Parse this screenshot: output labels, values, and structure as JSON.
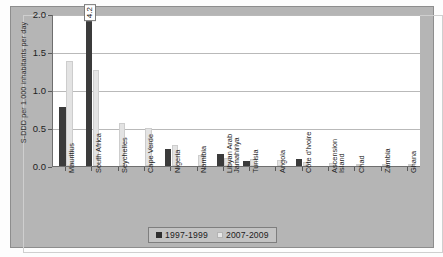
{
  "chart_data": {
    "type": "bar",
    "title": "",
    "xlabel": "",
    "ylabel": "S-DDD per 1.000 inhabitants per day",
    "ylim": [
      0,
      2.0
    ],
    "yticks": [
      "0.0",
      "0.5",
      "1.0",
      "1.5",
      "2.0"
    ],
    "grid": true,
    "legend_position": "bottom",
    "categories": [
      "Mauritius",
      "South Africa",
      "Seychelles",
      "Cape Verde",
      "Nigeria",
      "Namibia",
      "Libyan Arab Jamahiriya",
      "Tunisia",
      "Angola",
      "Côte d'Ivoire",
      "Ascension Island",
      "Chad",
      "Zambia",
      "Ghana"
    ],
    "series": [
      {
        "name": "1997-1999",
        "color": "#3b3b3b",
        "values": [
          0.78,
          4.2,
          0.0,
          0.0,
          0.22,
          0.0,
          0.16,
          0.07,
          0.0,
          0.09,
          0.0,
          0.0,
          0.0,
          0.0
        ]
      },
      {
        "name": "2007-2009",
        "color": "#e3e3e3",
        "values": [
          1.38,
          1.27,
          0.56,
          0.5,
          0.28,
          0.14,
          0.1,
          0.09,
          0.08,
          0.05,
          0.04,
          0.03,
          0.02,
          0.02
        ]
      }
    ],
    "annotations": [
      {
        "category": "South Africa",
        "series": "1997-1999",
        "label": "4.2",
        "note": "bar clipped at axis maximum"
      }
    ]
  },
  "legend": {
    "items": [
      {
        "label": "1997-1999"
      },
      {
        "label": "2007-2009"
      }
    ]
  }
}
